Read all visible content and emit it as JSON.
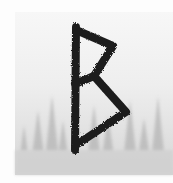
{
  "image": {
    "subject": "Berkano rune drawn in dark brush strokes over a misty pine forest",
    "colors": {
      "background": "#fdfdfd",
      "mist_top": "#f2f2f2",
      "mist_bottom": "#d9d9d9",
      "trees": "#b5b5b5",
      "rune": "#1e1e1e"
    }
  }
}
